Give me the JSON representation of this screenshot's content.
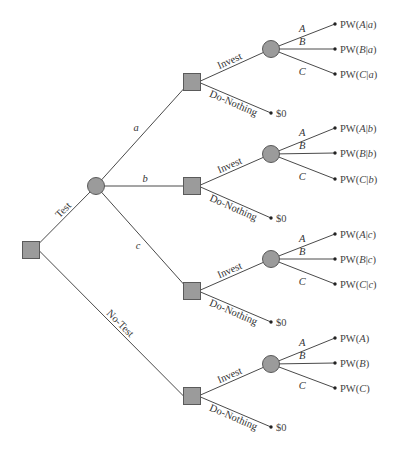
{
  "diagram": {
    "type": "decision-tree",
    "root": {
      "id": "root-decision",
      "shape": "square",
      "x": 31,
      "y": 250
    },
    "test_chance": {
      "id": "test-outcome-chance",
      "shape": "circle",
      "x": 96,
      "y": 186
    },
    "colors": {
      "node_fill": "#9b9b9b",
      "node_stroke": "#5a5a5a",
      "edge": "#4a4a4a",
      "text": "#333333"
    },
    "root_branches": [
      {
        "label": "Test",
        "to": "test_chance"
      },
      {
        "label": "No-Test",
        "to": "subtree.3"
      }
    ],
    "test_outcome_labels": [
      "a",
      "b",
      "c"
    ],
    "subtrees": [
      {
        "outcome": "a",
        "decision": {
          "x": 192,
          "y": 82
        },
        "chance": {
          "x": 271,
          "y": 49
        },
        "invest_label": "Invest",
        "do_nothing_label": "Do-Nothing",
        "do_nothing_value": "$0",
        "do_nothing_point": {
          "x": 271,
          "y": 113
        },
        "outcomes": [
          {
            "label": "A",
            "value_prefix": "PW(",
            "var": "A",
            "cond": "|a",
            "suffix": ")",
            "y": 24
          },
          {
            "label": "B",
            "value_prefix": "PW(",
            "var": "B",
            "cond": "|a",
            "suffix": ")",
            "y": 49
          },
          {
            "label": "C",
            "value_prefix": "PW(",
            "var": "C",
            "cond": "|a",
            "suffix": ")",
            "y": 74
          }
        ]
      },
      {
        "outcome": "b",
        "decision": {
          "x": 192,
          "y": 186
        },
        "chance": {
          "x": 271,
          "y": 154
        },
        "invest_label": "Invest",
        "do_nothing_label": "Do-Nothing",
        "do_nothing_value": "$0",
        "do_nothing_point": {
          "x": 271,
          "y": 218
        },
        "outcomes": [
          {
            "label": "A",
            "value_prefix": "PW(",
            "var": "A",
            "cond": "|b",
            "suffix": ")",
            "y": 128
          },
          {
            "label": "B",
            "value_prefix": "PW(",
            "var": "B",
            "cond": "|b",
            "suffix": ")",
            "y": 153
          },
          {
            "label": "C",
            "value_prefix": "PW(",
            "var": "C",
            "cond": "|b",
            "suffix": ")",
            "y": 179
          }
        ]
      },
      {
        "outcome": "c",
        "decision": {
          "x": 192,
          "y": 291
        },
        "chance": {
          "x": 271,
          "y": 259
        },
        "invest_label": "Invest",
        "do_nothing_label": "Do-Nothing",
        "do_nothing_value": "$0",
        "do_nothing_point": {
          "x": 271,
          "y": 322
        },
        "outcomes": [
          {
            "label": "A",
            "value_prefix": "PW(",
            "var": "A",
            "cond": "|c",
            "suffix": ")",
            "y": 234
          },
          {
            "label": "B",
            "value_prefix": "PW(",
            "var": "B",
            "cond": "|c",
            "suffix": ")",
            "y": 259
          },
          {
            "label": "C",
            "value_prefix": "PW(",
            "var": "C",
            "cond": "|c",
            "suffix": ")",
            "y": 284
          }
        ]
      },
      {
        "outcome": "No-Test",
        "decision": {
          "x": 192,
          "y": 396
        },
        "chance": {
          "x": 271,
          "y": 364
        },
        "invest_label": "Invest",
        "do_nothing_label": "Do-Nothing",
        "do_nothing_value": "$0",
        "do_nothing_point": {
          "x": 271,
          "y": 427
        },
        "outcomes": [
          {
            "label": "A",
            "value_prefix": "PW(",
            "var": "A",
            "cond": "",
            "suffix": ")",
            "y": 338
          },
          {
            "label": "B",
            "value_prefix": "PW(",
            "var": "B",
            "cond": "",
            "suffix": ")",
            "y": 363
          },
          {
            "label": "C",
            "value_prefix": "PW(",
            "var": "C",
            "cond": "",
            "suffix": ")",
            "y": 388
          }
        ]
      }
    ],
    "terminal_x": 335
  }
}
